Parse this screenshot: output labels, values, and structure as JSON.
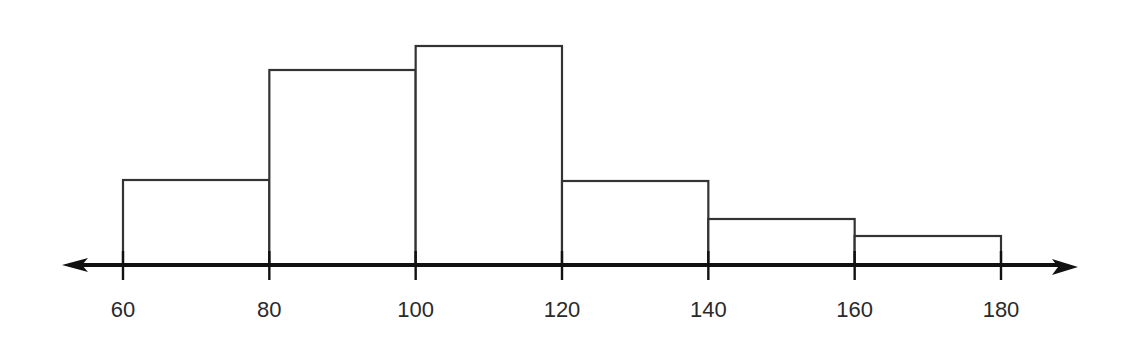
{
  "chart_data": {
    "type": "bar",
    "subtype": "histogram",
    "title": "",
    "xlabel": "",
    "ylabel": "",
    "bin_edges": [
      60,
      80,
      100,
      120,
      140,
      160,
      180
    ],
    "categories": [
      "60-80",
      "80-100",
      "100-120",
      "120-140",
      "140-160",
      "160-180"
    ],
    "values": [
      85,
      195,
      219,
      84,
      46,
      29
    ],
    "value_units": "relative bar height (no y-axis shown)",
    "x_ticks": [
      "60",
      "80",
      "100",
      "120",
      "140",
      "160",
      "180"
    ],
    "xlim": [
      60,
      180
    ],
    "grid": false,
    "legend": null,
    "axis_style": "number line with arrowheads on both ends",
    "colors": {
      "bar_fill": "#ffffff",
      "bar_stroke": "#333333",
      "axis": "#111111",
      "text": "#2a2a2a"
    }
  },
  "layout": {
    "baseline_y": 265,
    "x0_px": 123,
    "x_end_px": 1001,
    "axis_left_px": 62,
    "axis_right_px": 1078,
    "label_y": 317
  }
}
